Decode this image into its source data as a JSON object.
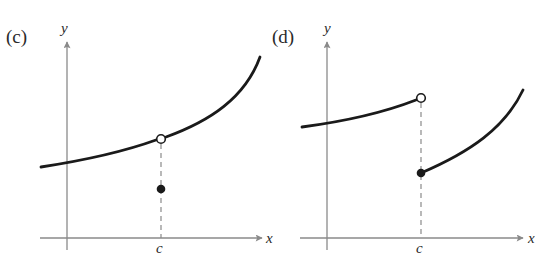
{
  "panels": [
    {
      "id": "c",
      "label": "(c)",
      "x_axis_label": "x",
      "y_axis_label": "y",
      "tick_label": "c",
      "description": "Continuous curve with a removable discontinuity at x = c: open circle on the curve, filled point below it."
    },
    {
      "id": "d",
      "label": "(d)",
      "x_axis_label": "x",
      "y_axis_label": "y",
      "tick_label": "c",
      "description": "Jump discontinuity at x = c: left branch ends in an open circle, right branch starts at a filled point lower down."
    }
  ],
  "colors": {
    "axis": "#8a8a8a",
    "curve": "#1a1a1a",
    "text": "#2a2a2a",
    "background": "#ffffff"
  }
}
